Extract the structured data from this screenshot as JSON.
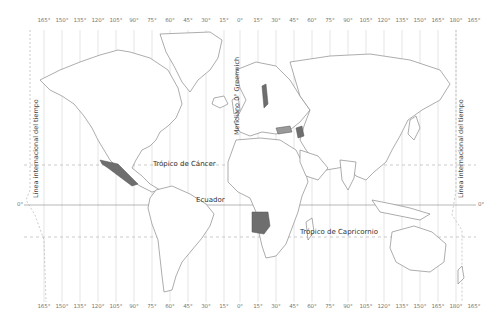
{
  "map": {
    "type": "world-political-mercator",
    "top_ticks": [
      "165°",
      "150°",
      "135°",
      "120°",
      "105°",
      "90°",
      "75°",
      "60°",
      "45°",
      "30°",
      "15°",
      "0°",
      "15°",
      "30°",
      "45°",
      "60°",
      "75°",
      "90°",
      "105°",
      "120°",
      "135°",
      "150°",
      "165°",
      "180°",
      "165°"
    ],
    "bottom_ticks": [
      "165°",
      "150°",
      "135°",
      "120°",
      "105°",
      "90°",
      "75°",
      "60°",
      "45°",
      "30°",
      "15°",
      "0°",
      "15°",
      "30°",
      "45°",
      "60°",
      "75°",
      "90°",
      "105°",
      "120°",
      "135°",
      "150°",
      "165°",
      "180°",
      "165°"
    ],
    "lines": {
      "tropic_of_cancer": "Trópico de Cáncer",
      "equator": "Ecuador",
      "tropic_of_capricorn": "Trópico de Capricornio",
      "greenwich": "Meridiano 0° Greenwich",
      "date_line_left": "Línea internacional del tiempo",
      "date_line_right": "Línea internacional del tiempo",
      "equator_deg_left": "0°",
      "equator_deg_right": "0°"
    },
    "highlighted_countries": [
      "Mexico",
      "Angola"
    ],
    "colors": {
      "land_fill": "#ffffff",
      "border": "#8a8a8a",
      "highlight": "#6e6e6e",
      "water_shading": "#d8d8d8",
      "grid": "#cfcfcf",
      "text": "#333333"
    }
  }
}
